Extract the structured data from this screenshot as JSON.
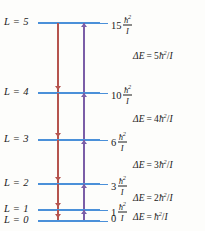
{
  "figure": {
    "kind": "rotational-energy-level-diagram",
    "colors": {
      "level_line": "#4a90d9",
      "emission_arrow": "#b5544e",
      "absorption_arrow": "#7b5ea7",
      "text": "#1a1a1a",
      "background": "#fdfdfb"
    }
  },
  "levels": [
    {
      "label": "L = 5",
      "quantum_number": 5,
      "coefficient": "15",
      "numerator": "ħ",
      "numerator_exponent": "2",
      "denominator": "I",
      "energy_units_of_hbar2_over_I": 15,
      "y": 22
    },
    {
      "label": "L = 4",
      "quantum_number": 4,
      "coefficient": "10",
      "numerator": "ħ",
      "numerator_exponent": "2",
      "denominator": "I",
      "energy_units_of_hbar2_over_I": 10,
      "y": 92
    },
    {
      "label": "L = 3",
      "quantum_number": 3,
      "coefficient": "6",
      "numerator": "ħ",
      "numerator_exponent": "2",
      "denominator": "I",
      "energy_units_of_hbar2_over_I": 6,
      "y": 139
    },
    {
      "label": "L = 2",
      "quantum_number": 2,
      "coefficient": "3",
      "numerator": "ħ",
      "numerator_exponent": "2",
      "denominator": "I",
      "energy_units_of_hbar2_over_I": 3,
      "y": 183
    },
    {
      "label": "L = 1",
      "quantum_number": 1,
      "coefficient": "1",
      "numerator": "ħ",
      "numerator_exponent": "2",
      "denominator": "I",
      "energy_units_of_hbar2_over_I": 1,
      "y": 209
    },
    {
      "label": "L = 0",
      "quantum_number": 0,
      "coefficient": "0",
      "numerator": "",
      "numerator_exponent": "",
      "denominator": "",
      "energy_units_of_hbar2_over_I": 0,
      "y": 220
    }
  ],
  "transitions": [
    {
      "name": "emission-column",
      "direction": "down",
      "color": "#b5544e",
      "x": 57,
      "from_level": 5,
      "to_level": 0
    },
    {
      "name": "absorption-column",
      "direction": "up",
      "color": "#7b5ea7",
      "x": 83,
      "from_level": 0,
      "to_level": 5
    }
  ],
  "delta_equations": [
    {
      "lhs": "ΔE",
      "op": "=",
      "coefficient": "5",
      "hbar": "ħ",
      "exponent": "2",
      "slash": "/",
      "denominator": "I",
      "text": "ΔE = 5ħ²/I",
      "y": 51
    },
    {
      "lhs": "ΔE",
      "op": "=",
      "coefficient": "4",
      "hbar": "ħ",
      "exponent": "2",
      "slash": "/",
      "denominator": "I",
      "text": "ΔE = 4ħ²/I",
      "y": 114
    },
    {
      "lhs": "ΔE",
      "op": "=",
      "coefficient": "3",
      "hbar": "ħ",
      "exponent": "2",
      "slash": "/",
      "denominator": "I",
      "text": "ΔE = 3ħ²/I",
      "y": 160
    },
    {
      "lhs": "ΔE",
      "op": "=",
      "coefficient": "2",
      "hbar": "ħ",
      "exponent": "2",
      "slash": "/",
      "denominator": "I",
      "text": "ΔE = 2ħ²/I",
      "y": 193
    },
    {
      "lhs": "ΔE",
      "op": "=",
      "coefficient": "",
      "hbar": "ħ",
      "exponent": "2",
      "slash": "/",
      "denominator": "I",
      "text": "ΔE = ħ²/I",
      "y": 212
    }
  ]
}
